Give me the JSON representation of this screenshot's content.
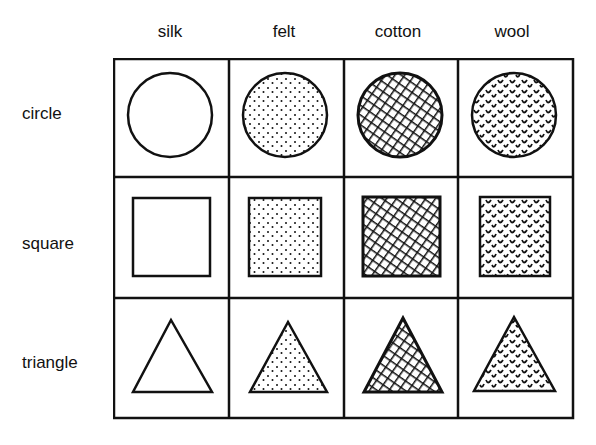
{
  "columns": [
    "silk",
    "felt",
    "cotton",
    "wool"
  ],
  "rows": [
    "circle",
    "square",
    "triangle"
  ],
  "cells": [
    [
      {
        "shape": "circle",
        "fill": "silk"
      },
      {
        "shape": "circle",
        "fill": "felt"
      },
      {
        "shape": "circle",
        "fill": "cotton"
      },
      {
        "shape": "circle",
        "fill": "wool"
      }
    ],
    [
      {
        "shape": "square",
        "fill": "silk"
      },
      {
        "shape": "square",
        "fill": "felt"
      },
      {
        "shape": "square",
        "fill": "cotton"
      },
      {
        "shape": "square",
        "fill": "wool"
      }
    ],
    [
      {
        "shape": "triangle",
        "fill": "silk"
      },
      {
        "shape": "triangle",
        "fill": "felt"
      },
      {
        "shape": "triangle",
        "fill": "cotton"
      },
      {
        "shape": "triangle",
        "fill": "wool"
      }
    ]
  ],
  "fill_descriptions": {
    "silk": "plain white",
    "felt": "stippled dots",
    "cotton": "diagonal crosshatch",
    "wool": "curly texture"
  },
  "colors": {
    "ink": "#111111",
    "background": "#ffffff"
  }
}
